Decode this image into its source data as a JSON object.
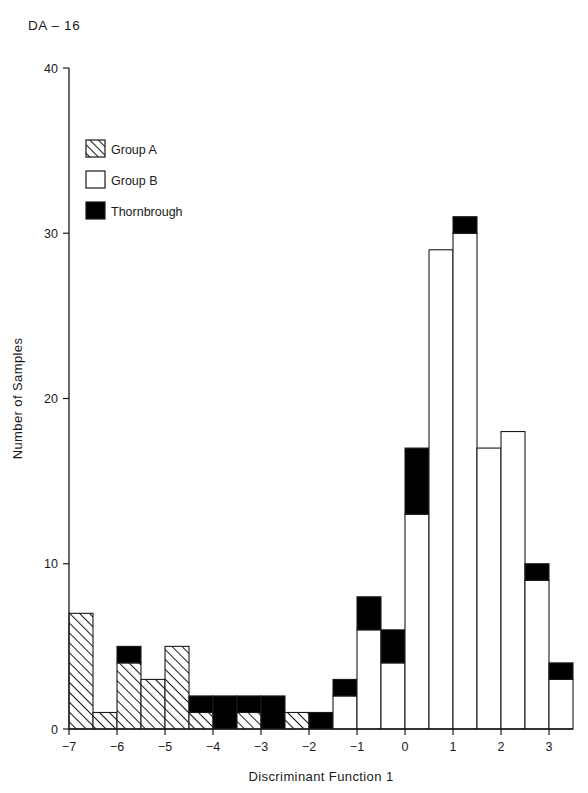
{
  "plate": {
    "label": "DA – 16"
  },
  "legend": {
    "position": "top-left-inside",
    "entries": [
      {
        "key": "group_a",
        "label": "Group A",
        "fill": "hatched",
        "color": "#ffffff"
      },
      {
        "key": "group_b",
        "label": "Group B",
        "fill": "solid",
        "color": "#ffffff"
      },
      {
        "key": "thornbrough",
        "label": "Thornbrough",
        "fill": "solid",
        "color": "#000000"
      }
    ]
  },
  "chart_data": {
    "type": "bar",
    "subtype": "stacked-histogram",
    "title": "DA – 16",
    "xlabel": "Discriminant Function 1",
    "ylabel": "Number of Samples",
    "xlim": [
      -7,
      3.5
    ],
    "ylim": [
      0,
      40
    ],
    "grid": false,
    "bin_width": 0.5,
    "xticks": [
      -7,
      -6,
      -5,
      -4,
      -3,
      -2,
      -1,
      0,
      1,
      2,
      3
    ],
    "xtick_labels": [
      "−7",
      "−6",
      "−5",
      "−4",
      "−3",
      "−2",
      "−1",
      "0",
      "1",
      "2",
      "3"
    ],
    "yticks": [
      0,
      10,
      20,
      30,
      40
    ],
    "ytick_labels": [
      "0",
      "10",
      "20",
      "30",
      "40"
    ],
    "legend_entries": [
      "Group A",
      "Group B",
      "Thornbrough"
    ],
    "series": [
      {
        "name": "Group A",
        "values": [
          7,
          1,
          4,
          3,
          5,
          1,
          0,
          1,
          0,
          1,
          0,
          0,
          0,
          0,
          0,
          0,
          0,
          0,
          0,
          0,
          0
        ]
      },
      {
        "name": "Group B",
        "values": [
          0,
          0,
          0,
          0,
          0,
          0,
          0,
          0,
          0,
          0,
          0,
          2,
          6,
          4,
          13,
          29,
          30,
          17,
          18,
          9,
          3
        ]
      },
      {
        "name": "Thornbrough",
        "values": [
          0,
          0,
          1,
          0,
          0,
          1,
          2,
          1,
          2,
          0,
          1,
          1,
          2,
          2,
          4,
          0,
          1,
          0,
          0,
          1,
          1
        ]
      }
    ],
    "bins": [
      {
        "left": -7.0,
        "right": -6.5,
        "group_a": 7,
        "group_b": 0,
        "thornbrough": 0,
        "total": 7
      },
      {
        "left": -6.5,
        "right": -6.0,
        "group_a": 1,
        "group_b": 0,
        "thornbrough": 0,
        "total": 1
      },
      {
        "left": -6.0,
        "right": -5.5,
        "group_a": 4,
        "group_b": 0,
        "thornbrough": 1,
        "total": 5
      },
      {
        "left": -5.5,
        "right": -5.0,
        "group_a": 3,
        "group_b": 0,
        "thornbrough": 0,
        "total": 3
      },
      {
        "left": -5.0,
        "right": -4.5,
        "group_a": 5,
        "group_b": 0,
        "thornbrough": 0,
        "total": 5
      },
      {
        "left": -4.5,
        "right": -4.0,
        "group_a": 1,
        "group_b": 0,
        "thornbrough": 1,
        "total": 2
      },
      {
        "left": -4.0,
        "right": -3.5,
        "group_a": 0,
        "group_b": 0,
        "thornbrough": 2,
        "total": 2
      },
      {
        "left": -3.5,
        "right": -3.0,
        "group_a": 1,
        "group_b": 0,
        "thornbrough": 1,
        "total": 2
      },
      {
        "left": -3.0,
        "right": -2.5,
        "group_a": 0,
        "group_b": 0,
        "thornbrough": 2,
        "total": 2
      },
      {
        "left": -2.5,
        "right": -2.0,
        "group_a": 1,
        "group_b": 0,
        "thornbrough": 0,
        "total": 1
      },
      {
        "left": -2.0,
        "right": -1.5,
        "group_a": 0,
        "group_b": 0,
        "thornbrough": 1,
        "total": 1
      },
      {
        "left": -1.5,
        "right": -1.0,
        "group_a": 0,
        "group_b": 2,
        "thornbrough": 1,
        "total": 3
      },
      {
        "left": -1.0,
        "right": -0.5,
        "group_a": 0,
        "group_b": 6,
        "thornbrough": 2,
        "total": 8
      },
      {
        "left": -0.5,
        "right": 0.0,
        "group_a": 0,
        "group_b": 4,
        "thornbrough": 2,
        "total": 6
      },
      {
        "left": 0.0,
        "right": 0.5,
        "group_a": 0,
        "group_b": 13,
        "thornbrough": 4,
        "total": 17
      },
      {
        "left": 0.5,
        "right": 1.0,
        "group_a": 0,
        "group_b": 29,
        "thornbrough": 0,
        "total": 29
      },
      {
        "left": 1.0,
        "right": 1.5,
        "group_a": 0,
        "group_b": 30,
        "thornbrough": 1,
        "total": 31
      },
      {
        "left": 1.5,
        "right": 2.0,
        "group_a": 0,
        "group_b": 17,
        "thornbrough": 0,
        "total": 17
      },
      {
        "left": 2.0,
        "right": 2.5,
        "group_a": 0,
        "group_b": 18,
        "thornbrough": 0,
        "total": 18
      },
      {
        "left": 2.5,
        "right": 3.0,
        "group_a": 0,
        "group_b": 9,
        "thornbrough": 1,
        "total": 10
      },
      {
        "left": 3.0,
        "right": 3.5,
        "group_a": 0,
        "group_b": 3,
        "thornbrough": 1,
        "total": 4
      }
    ]
  }
}
